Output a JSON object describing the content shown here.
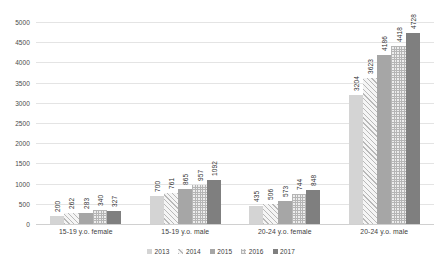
{
  "chart_data": {
    "type": "bar",
    "title": "",
    "subtitle": "",
    "xlabel": "",
    "ylabel": "",
    "ylim": [
      0,
      5000
    ],
    "ytick_step": 500,
    "yticks": [
      "0",
      "500",
      "1000",
      "1500",
      "2000",
      "2500",
      "3000",
      "3500",
      "4000",
      "4500",
      "5000"
    ],
    "grid": true,
    "legend_position": "bottom",
    "categories": [
      "15-19 y.o. female",
      "15-19 y.o. male",
      "20-24 y.o. female",
      "20-24 y.o. male"
    ],
    "series": [
      {
        "name": "2013",
        "values": [
          200,
          700,
          435,
          3204
        ],
        "pattern": "solid-light"
      },
      {
        "name": "2014",
        "values": [
          262,
          761,
          506,
          3623
        ],
        "pattern": "diagonal-hatch"
      },
      {
        "name": "2015",
        "values": [
          283,
          865,
          573,
          4186
        ],
        "pattern": "solid-medium"
      },
      {
        "name": "2016",
        "values": [
          340,
          957,
          744,
          4418
        ],
        "pattern": "checkered"
      },
      {
        "name": "2017",
        "values": [
          327,
          1092,
          848,
          4728
        ],
        "pattern": "solid-dark"
      }
    ]
  },
  "colors": {
    "series_2013": "#d4d4d4",
    "series_2014": "#f2f2f2",
    "series_2015": "#a6a6a6",
    "series_2016": "#ededed",
    "series_2017": "#7f7f7f",
    "gridline": "#e4e4e4",
    "text": "#3d3d3d",
    "background": "#ffffff"
  }
}
